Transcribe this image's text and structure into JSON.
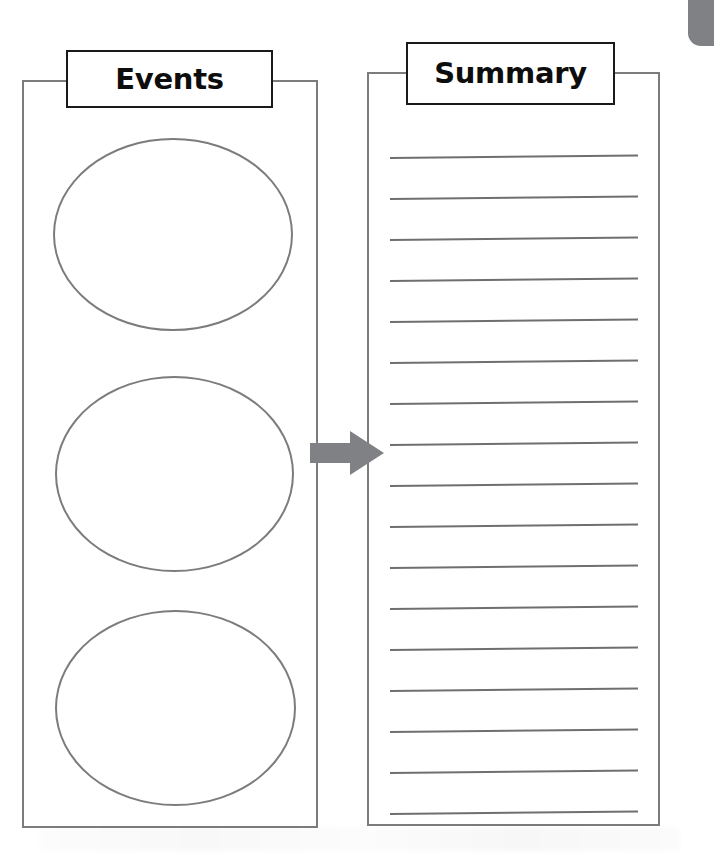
{
  "worksheet": {
    "title": "Events and Summary Graphic Organizer",
    "background_color": "#ffffff",
    "stroke_color": "#7c7c7c",
    "header_stroke_color": "#1a1a1a",
    "arrow_color": "#7f8184",
    "corner_tab_color": "#7f8184"
  },
  "columns": [
    {
      "id": "events",
      "header_label": "Events",
      "type": "ellipses",
      "frame": {
        "x": 22,
        "y": 80,
        "width": 296,
        "height": 748
      },
      "header_box": {
        "x": 66,
        "y": 50,
        "width": 207,
        "height": 58
      },
      "shapes": [
        {
          "name": "event-ellipse-1",
          "x": 53,
          "y": 138,
          "width": 240,
          "height": 193
        },
        {
          "name": "event-ellipse-2",
          "x": 55,
          "y": 376,
          "width": 239,
          "height": 196
        },
        {
          "name": "event-ellipse-3",
          "x": 55,
          "y": 610,
          "width": 241,
          "height": 196
        }
      ]
    },
    {
      "id": "summary",
      "header_label": "Summary",
      "type": "ruled-lines",
      "frame": {
        "x": 367,
        "y": 72,
        "width": 293,
        "height": 754
      },
      "header_box": {
        "x": 406,
        "y": 42,
        "width": 209,
        "height": 63
      },
      "lines": {
        "count": 17,
        "first_y": 157,
        "spacing": 41,
        "x": 390,
        "width": 248,
        "tilt_degrees": -0.55
      }
    }
  ],
  "arrow": {
    "name": "flow-arrow-right",
    "direction": "right",
    "x": 310,
    "y": 431,
    "width": 74,
    "height": 44,
    "color": "#7f8184"
  }
}
